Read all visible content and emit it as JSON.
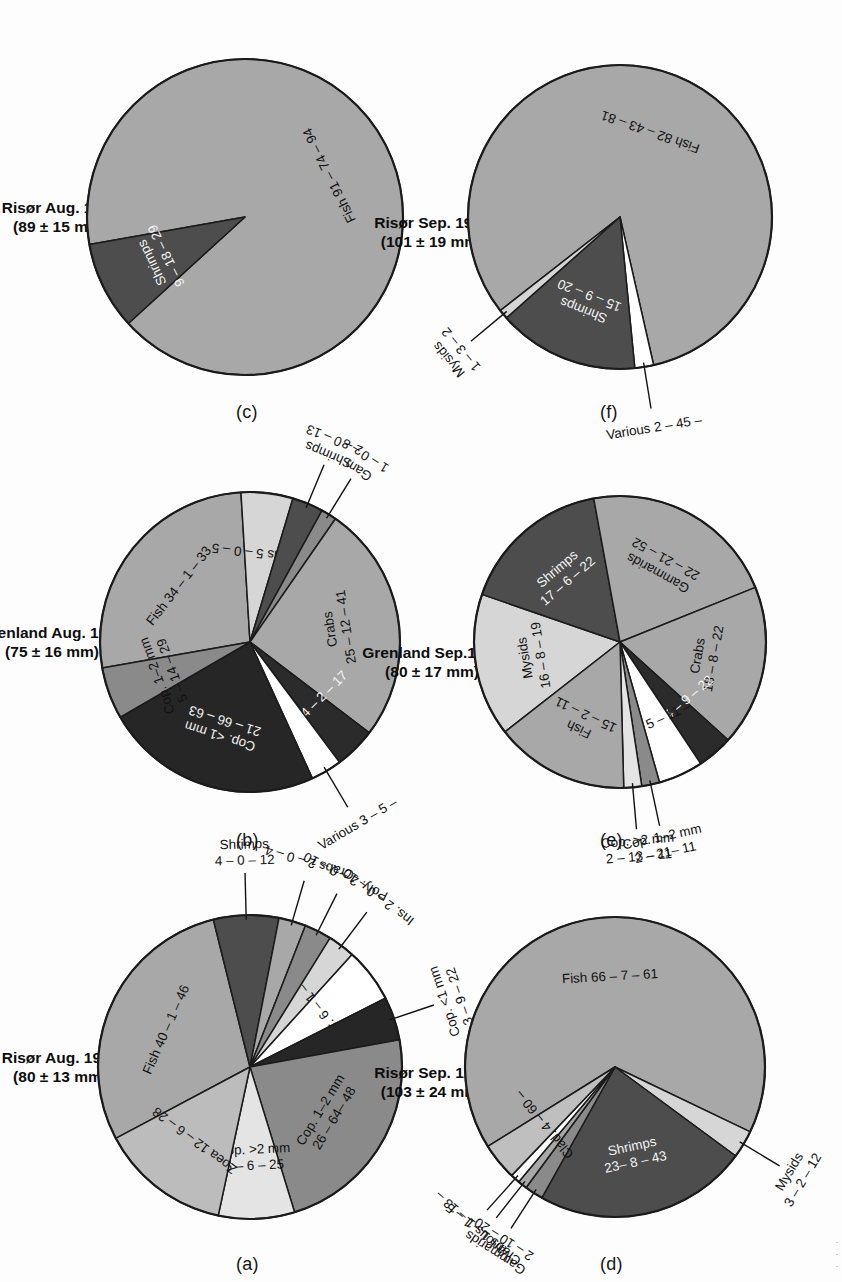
{
  "figure": {
    "palette": {
      "fish": "#a8a8a8",
      "shrimps": "#4d4d4d",
      "crabs": "#a8a8a8",
      "gammarids": "#a8a8a8",
      "mysids": "#d6d6d6",
      "cop_lt1": "#262626",
      "cop_1_2": "#8a8a8a",
      "cop_gt2": "#e4e4e4",
      "zoea": "#bcbcbc",
      "moll": "#2b2b2b",
      "various": "#ffffff",
      "clad": "#bfbfbf",
      "outline": "#1b1b1b",
      "background": "#fdfdfd"
    },
    "panels": [
      {
        "id": "a",
        "letter": "(a)",
        "title": "Risør Aug. 1996\n(80 ± 13 mm)",
        "chart_data": {
          "type": "pie",
          "title": "Risør Aug. 1996 (80 ± 13 mm)",
          "legend": "none",
          "slices": [
            {
              "name": "Fish",
              "label": "Fish 40 – 1 – 46",
              "value": 25.0,
              "color_key": "fish",
              "placement": "inside"
            },
            {
              "name": "Shrimps",
              "label": "Shrimps\n4 – 0 – 12",
              "value": 6.0,
              "color_key": "shrimps",
              "placement": "outside"
            },
            {
              "name": "Crabs",
              "label": "Crabs 2 – 0 – 4",
              "value": 2.5,
              "color_key": "crabs",
              "placement": "outside"
            },
            {
              "name": "Poly.",
              "label": "Poly. 2 – 0 – 10",
              "value": 2.5,
              "color_key": "cop_1_2",
              "placement": "outside"
            },
            {
              "name": "Ins.",
              "label": "Ins. 2 – 0 – 10",
              "value": 2.5,
              "color_key": "mysids",
              "placement": "outside"
            },
            {
              "name": "Var.",
              "label": "Var. 6 – 1 –",
              "value": 5.0,
              "color_key": "various",
              "placement": "inside"
            },
            {
              "name": "Cop. <1 mm",
              "label": "Cop. <1 mm\n3 – 9 – 22",
              "value": 4.0,
              "color_key": "cop_lt1",
              "placement": "outside"
            },
            {
              "name": "Cop. 1–2 mm",
              "label": "Cop. 1–2 mm\n26 – 64– 48",
              "value": 20.0,
              "color_key": "cop_1_2",
              "placement": "inside"
            },
            {
              "name": "Cop. >2 mm",
              "label": "Cop. >2 mm\n6 – 6 – 25",
              "value": 7.0,
              "color_key": "cop_gt2",
              "placement": "inside"
            },
            {
              "name": "Zoea",
              "label": "Zoea 12 – 6 – 28",
              "value": 12.0,
              "color_key": "zoea",
              "placement": "inside"
            }
          ]
        }
      },
      {
        "id": "b",
        "letter": "(b)",
        "title": "Grenland Aug. 1996\n(75 ± 16 mm)",
        "chart_data": {
          "type": "pie",
          "title": "Grenland Aug. 1996 (75 ± 16 mm)",
          "legend": "none",
          "slices": [
            {
              "name": "Fish",
              "label": "Fish 34 – 1 – 33",
              "value": 24.0,
              "color_key": "fish",
              "placement": "inside"
            },
            {
              "name": "Mysids",
              "label": "Mysids 5 – 0 – 5",
              "value": 5.0,
              "color_key": "mysids",
              "placement": "inside"
            },
            {
              "name": "Shrimps",
              "label": "Shrimps\n2 – 0 – 13",
              "value": 3.0,
              "color_key": "shrimps",
              "placement": "outside"
            },
            {
              "name": "Gam.",
              "label": "Gam.\n1 – 0 – 8",
              "value": 1.5,
              "color_key": "cop_1_2",
              "placement": "outside"
            },
            {
              "name": "Crabs",
              "label": "Crabs\n25 – 12 – 41",
              "value": 23.0,
              "color_key": "crabs",
              "placement": "inside"
            },
            {
              "name": "Moll.",
              "label": "Moll. 4 – 2 – 17",
              "value": 4.0,
              "color_key": "moll",
              "placement": "inside"
            },
            {
              "name": "Various",
              "label": "Various 3 – 5 –",
              "value": 3.0,
              "color_key": "various",
              "placement": "outside"
            },
            {
              "name": "Cop. <1 mm",
              "label": "Cop. <1 mm\n21 – 66 – 63",
              "value": 21.0,
              "color_key": "cop_lt1",
              "placement": "inside"
            },
            {
              "name": "Cop. 1–2 mm",
              "label": "Cop. 1–2 mm\n5 – 14 – 29",
              "value": 5.0,
              "color_key": "cop_1_2",
              "placement": "inside"
            }
          ]
        }
      },
      {
        "id": "c",
        "letter": "(c)",
        "title": "Risør Aug. 1997\n(89 ± 15 mm)",
        "chart_data": {
          "type": "pie",
          "title": "Risør Aug. 1997 (89 ± 15 mm)",
          "legend": "none",
          "slices": [
            {
              "name": "Fish",
              "label": "Fish 91 – 74 – 94",
              "value": 91.0,
              "color_key": "fish",
              "placement": "inside"
            },
            {
              "name": "Shrimps",
              "label": "Shrimps\n9 – 18 – 29",
              "value": 9.0,
              "color_key": "shrimps",
              "placement": "inside"
            }
          ]
        }
      },
      {
        "id": "d",
        "letter": "(d)",
        "title": "Risør Sep. 1996\n(103 ± 24 mm)",
        "chart_data": {
          "type": "pie",
          "title": "Risør Sep. 1996 (103 ± 24 mm)",
          "legend": "none",
          "slices": [
            {
              "name": "Fish",
              "label": "Fish 66 – 7 – 61",
              "value": 66.0,
              "color_key": "fish",
              "placement": "inside"
            },
            {
              "name": "Mysids",
              "label": "Mysids\n3 – 2 – 12",
              "value": 3.0,
              "color_key": "mysids",
              "placement": "outside"
            },
            {
              "name": "Shrimps",
              "label": "Shrimps\n23– 8 – 43",
              "value": 23.0,
              "color_key": "shrimps",
              "placement": "inside"
            },
            {
              "name": "Gammarids",
              "label": "Gammarids\n2 – 10 – 20",
              "value": 2.0,
              "color_key": "cop_1_2",
              "placement": "outside"
            },
            {
              "name": "Crabs",
              "label": "Crabs 1 – 1 – 5",
              "value": 1.0,
              "color_key": "crabs",
              "placement": "outside"
            },
            {
              "name": "Various",
              "label": "Various 1 – 13 –",
              "value": 1.0,
              "color_key": "various",
              "placement": "outside"
            },
            {
              "name": "Clad.",
              "label": "Clad. 4 – 60 –",
              "value": 4.0,
              "color_key": "clad",
              "placement": "inside"
            }
          ]
        }
      },
      {
        "id": "e",
        "letter": "(e)",
        "title": "Grenland Sep.1996\n(80 ± 17 mm)",
        "chart_data": {
          "type": "pie",
          "title": "Grenland Sep. 1996 (80 ± 17 mm)",
          "legend": "none",
          "slices": [
            {
              "name": "Mysids",
              "label": "Mysids\n16 – 8 – 19",
              "value": 16.0,
              "color_key": "mysids",
              "placement": "inside"
            },
            {
              "name": "Shrimps",
              "label": "Shrimps\n17 – 6 – 22",
              "value": 17.0,
              "color_key": "shrimps",
              "placement": "inside"
            },
            {
              "name": "Gammarids",
              "label": "Gammarids\n22 – 21 – 52",
              "value": 22.0,
              "color_key": "gammarids",
              "placement": "inside"
            },
            {
              "name": "Crabs",
              "label": "Crabs\n18 – 8 – 22",
              "value": 18.0,
              "color_key": "crabs",
              "placement": "inside"
            },
            {
              "name": "Moll.",
              "label": "Moll. 4 – 9 – 22",
              "value": 4.0,
              "color_key": "moll",
              "placement": "inside"
            },
            {
              "name": "Var.",
              "label": "Var. 5 – 11 –",
              "value": 5.0,
              "color_key": "various",
              "placement": "inside"
            },
            {
              "name": "Cop. 1–2 mm",
              "label": "Cop. 1–2 mm\n2 – 21– 11",
              "value": 2.0,
              "color_key": "cop_1_2",
              "placement": "outside"
            },
            {
              "name": "Cop. >2 mm",
              "label": "Cop. >2 mm\n2 – 13 – 11",
              "value": 2.0,
              "color_key": "cop_gt2",
              "placement": "outside"
            },
            {
              "name": "Fish",
              "label": "Fish\n15 – 2 – 11",
              "value": 15.0,
              "color_key": "fish",
              "placement": "inside"
            }
          ]
        }
      },
      {
        "id": "f",
        "letter": "(f)",
        "title": "Risør Sep. 1997\n(101 ± 19 mm)",
        "chart_data": {
          "type": "pie",
          "title": "Risør Sep. 1997 (101 ± 19 mm)",
          "legend": "none",
          "slices": [
            {
              "name": "Fish",
              "label": "Fish 82 – 43 – 81",
              "value": 82.0,
              "color_key": "fish",
              "placement": "inside"
            },
            {
              "name": "Various",
              "label": "Various 2 – 45 –",
              "value": 2.0,
              "color_key": "various",
              "placement": "outside"
            },
            {
              "name": "Shrimps",
              "label": "Shrimps\n15 – 9 – 20",
              "value": 15.0,
              "color_key": "shrimps",
              "placement": "inside"
            },
            {
              "name": "Mysids",
              "label": "Mysids\n1 – 3 – 2",
              "value": 1.0,
              "color_key": "mysids",
              "placement": "outside"
            }
          ]
        }
      }
    ]
  }
}
